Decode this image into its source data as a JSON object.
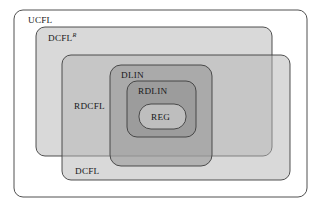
{
  "diagram": {
    "type": "nested-inclusion-venn",
    "background_color": "#ffffff",
    "stroke_color": "#3d3d3d",
    "text_color": "#18181a",
    "regions": [
      {
        "id": "ucfl",
        "label": "UCFL",
        "superscript": "",
        "fill": "#ffffff",
        "fill_opacity": 1,
        "x": 14,
        "y": 10,
        "width": 293,
        "height": 187,
        "rx": 9,
        "label_x": 28,
        "label_y": 23,
        "level": 0
      },
      {
        "id": "dcfl-r",
        "label": "DCFL",
        "superscript": "R",
        "fill": "#b4b4b4",
        "fill_opacity": 0.5,
        "x": 36,
        "y": 27,
        "width": 236,
        "height": 129,
        "rx": 9,
        "label_x": 48,
        "label_y": 41,
        "level": 1
      },
      {
        "id": "dcfl",
        "label": "DCFL",
        "superscript": "",
        "fill": "#b4b4b4",
        "fill_opacity": 0.5,
        "x": 62,
        "y": 55,
        "width": 228,
        "height": 125,
        "rx": 9,
        "label_x": 75,
        "label_y": 174,
        "level": 1
      },
      {
        "id": "rdcfl",
        "label": "RDCFL",
        "superscript": "",
        "fill": "#b4b4b4",
        "fill_opacity": 0.0,
        "x": 62,
        "y": 57,
        "width": 0,
        "height": 0,
        "rx": 0,
        "label_x": 74,
        "label_y": 109,
        "level": 2
      },
      {
        "id": "dlin",
        "label": "DLIN",
        "superscript": "",
        "fill": "#9a9a9a",
        "fill_opacity": 0.62,
        "x": 110,
        "y": 65,
        "width": 102,
        "height": 101,
        "rx": 11,
        "label_x": 121,
        "label_y": 78,
        "level": 3
      },
      {
        "id": "rdlin",
        "label": "RDLIN",
        "superscript": "",
        "fill": "#8f8f8f",
        "fill_opacity": 0.55,
        "x": 127,
        "y": 81,
        "width": 69,
        "height": 56,
        "rx": 10,
        "label_x": 138,
        "label_y": 94,
        "level": 4
      },
      {
        "id": "reg",
        "label": "REG",
        "superscript": "",
        "fill": "#c9c9c9",
        "fill_opacity": 0.75,
        "x": 139,
        "y": 104,
        "width": 47,
        "height": 25,
        "rx": 12,
        "label_x": 151,
        "label_y": 120,
        "level": 5
      }
    ]
  }
}
